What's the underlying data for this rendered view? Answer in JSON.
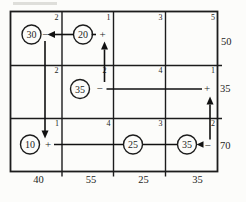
{
  "figure": {
    "type": "transportation-tableau-stepping-stone-loop",
    "rows": 3,
    "cols": 4,
    "unit_costs": [
      [
        2,
        1,
        3,
        5
      ],
      [
        2,
        2,
        4,
        1
      ],
      [
        1,
        4,
        3,
        2
      ]
    ],
    "allocations": {
      "r1c1": "30",
      "r1c2": "20",
      "r2c2": "35",
      "r3c1": "10",
      "r3c3": "25",
      "r3c4": "35"
    },
    "signs": {
      "r1c1": "−",
      "r1c2": "+",
      "r2c2": "−",
      "r2c4": "+",
      "r3c1": "+",
      "r3c4": "−"
    },
    "supply": [
      "50",
      "35",
      "70"
    ],
    "demand": [
      "40",
      "55",
      "25",
      "35"
    ],
    "loop_arrows": [
      {
        "from": "r1c2",
        "to": "r1c1",
        "direction": "left",
        "arrowhead": true
      },
      {
        "from": "r1c1",
        "to": "r3c1",
        "direction": "down",
        "arrowhead": true
      },
      {
        "from": "r2c2",
        "to": "r1c2",
        "direction": "up",
        "arrowhead": true
      },
      {
        "from": "r2c2",
        "to": "r2c4",
        "direction": "right",
        "arrowhead": false
      },
      {
        "from": "r3c1",
        "to": "r3c4",
        "direction": "right",
        "arrowhead": true
      },
      {
        "from": "r3c4",
        "to": "r2c4",
        "direction": "up",
        "arrowhead": true
      }
    ]
  },
  "colors": {
    "ink": "#1c1c1c",
    "paper": "#fcfcfa"
  }
}
